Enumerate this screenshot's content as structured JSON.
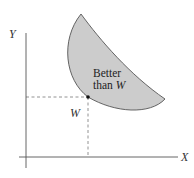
{
  "diagram": {
    "type": "indifference-region",
    "axes": {
      "x_label": "X",
      "y_label": "Y",
      "origin": [
        26,
        157
      ],
      "x_end": 178,
      "y_top": 33,
      "y_bottom": 168,
      "x_start": 19
    },
    "point": {
      "label": "W",
      "x": 88,
      "y": 97
    },
    "region": {
      "label_line1": "Better",
      "label_line2_prefix": "than ",
      "label_line2_var": "W",
      "fill_color": "#cccccc",
      "stroke_color": "#555555"
    },
    "colors": {
      "axis": "#555555",
      "dashed": "#777777",
      "point": "#111111"
    }
  }
}
